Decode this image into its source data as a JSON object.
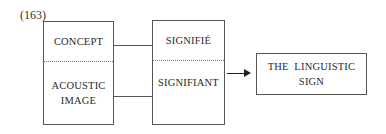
{
  "figure": {
    "number_label": "(163)"
  },
  "left_box": {
    "top_label": "CONCEPT",
    "bottom_label_line1": "ACOUSTIC",
    "bottom_label_line2": "IMAGE"
  },
  "middle_box": {
    "top_label": "SIGNIFIÉ",
    "bottom_label": "SIGNIFIANT"
  },
  "result_box": {
    "label_line1": "THE  LINGUISTIC",
    "label_line2": "SIGN"
  },
  "colors": {
    "line": "#555555",
    "arrow": "#222222",
    "text": "#2a2a2a"
  }
}
